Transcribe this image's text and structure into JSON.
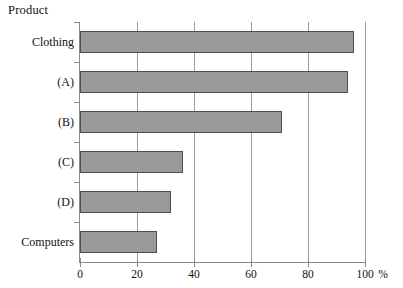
{
  "chart_data": {
    "type": "bar",
    "orientation": "horizontal",
    "title": "",
    "axis_title": "Product",
    "xlabel": "%",
    "ylabel": "Product",
    "categories": [
      "Clothing",
      "(A)",
      "(B)",
      "(C)",
      "(D)",
      "Computers"
    ],
    "values": [
      96,
      94,
      71,
      36,
      32,
      27
    ],
    "xlim": [
      0,
      100
    ],
    "xticks": [
      0,
      20,
      40,
      60,
      80,
      100
    ],
    "xtick_labels": [
      "0",
      "20",
      "40",
      "60",
      "80",
      "100"
    ],
    "unit": "%",
    "grid": true,
    "grid_axis": "x",
    "legend": null,
    "bar_fill_color": "#999999",
    "bar_border_color": "#4d4d4d",
    "axis_color": "#8a8a8a",
    "background_color": "#ffffff"
  },
  "labels": {
    "axis_title": "Product",
    "unit": "%"
  }
}
